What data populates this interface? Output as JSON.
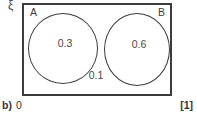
{
  "diagram": {
    "universe_label": "ξ",
    "set_a_label": "A",
    "set_b_label": "B",
    "value_a": "0.3",
    "value_b": "0.6",
    "value_outside": "0.1"
  },
  "footer": {
    "part_label": "b)",
    "answer_value": "0",
    "marks": "[1]"
  },
  "colors": {
    "line": "#3c3c3c",
    "text": "#474747",
    "background": "#ffffff"
  }
}
